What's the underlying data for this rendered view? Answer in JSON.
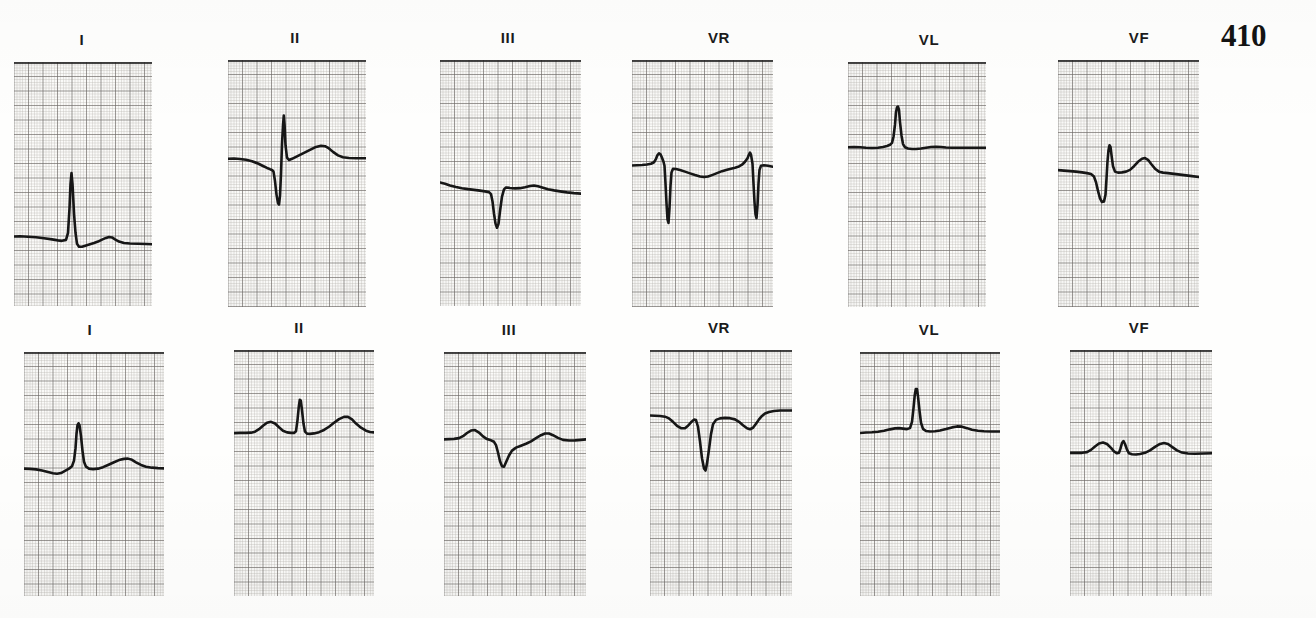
{
  "document": {
    "page_number": "410",
    "type": "ecg-recording",
    "rows": 2,
    "columns": 6
  },
  "chart_data": {
    "type": "line",
    "title": "",
    "subtitle": "",
    "xlabel": "",
    "ylabel": "",
    "grid": true,
    "legend_position": "none",
    "grid_small_px": 2.9,
    "grid_bold_every": 5,
    "rows": [
      {
        "row_index": 0,
        "row_name": "upper-recording",
        "strips": [
          {
            "label": "I",
            "label_x": 82,
            "x": 14,
            "y": 62,
            "width": 138,
            "height": 244,
            "baseline_y": 0.715,
            "points": "0,0.715 6,0.714 14,0.716 22,0.718 30,0.722 38,0.727 44,0.731 48,0.733 52,0.729 54,0.70 55.5,0.60 56.5,0.50 57.5,0.455 58.5,0.50 60,0.62 61.5,0.70 63,0.745 65,0.757 68,0.757 72,0.752 76,0.747 80,0.742 84,0.736 88,0.728 92,0.721 95,0.717 98,0.719 101,0.727 105,0.736 110,0.742 116,0.744 124,0.745 132,0.746 138,0.747"
          },
          {
            "label": "II",
            "label_x": 295,
            "x": 228,
            "y": 60,
            "width": 138,
            "height": 247,
            "baseline_y": 0.4,
            "points": "0,0.400 6,0.399 12,0.401 18,0.404 24,0.410 30,0.419 35,0.429 39,0.437 42,0.442 44,0.445 45.5,0.452 47,0.49 48.5,0.545 50,0.58 51,0.585 52,0.55 53,0.46 54,0.34 55,0.265 55.8,0.225 56.6,0.265 57.5,0.345 59,0.395 61,0.405 64,0.400 68,0.392 73,0.382 78,0.372 83,0.362 88,0.352 93,0.347 97,0.349 101,0.358 105,0.372 110,0.386 115,0.394 121,0.397 128,0.398 134,0.398 138,0.398"
          },
          {
            "label": "III",
            "label_x": 508,
            "x": 440,
            "y": 60,
            "width": 141,
            "height": 246,
            "baseline_y": 0.505,
            "points": "0,0.498 5,0.503 10,0.510 16,0.516 22,0.521 28,0.525 34,0.528 40,0.531 45,0.534 49,0.537 51,0.545 52.5,0.575 54,0.625 55.5,0.665 57,0.682 58.5,0.666 60,0.615 62,0.555 64,0.526 66,0.518 70,0.520 75,0.522 80,0.521 85,0.517 90,0.512 94,0.510 98,0.513 103,0.519 108,0.525 114,0.530 120,0.534 127,0.538 134,0.541 141,0.543"
          },
          {
            "label": "VR",
            "label_x": 719,
            "x": 632,
            "y": 60,
            "width": 141,
            "height": 247,
            "baseline_y": 0.42,
            "points": "0,0.427 5,0.426 10,0.425 15,0.423 19,0.420 22,0.414 24,0.400 25.5,0.385 27,0.378 28.5,0.382 30,0.396 31.5,0.412 32.5,0.428 33.5,0.50 34.5,0.58 35.5,0.645 36.5,0.66 37.5,0.60 38.5,0.51 39.5,0.455 41,0.440 44,0.441 48,0.445 53,0.452 58,0.459 63,0.466 68,0.472 72,0.474 76,0.472 80,0.466 85,0.458 90,0.450 95,0.444 99,0.440 103,0.436 107,0.431 110,0.424 113,0.412 115.5,0.398 117,0.383 118,0.375 119,0.383 120.5,0.42 121.5,0.50 122.5,0.575 123.5,0.625 124.5,0.64 125.5,0.59 126.5,0.50 127.5,0.445 129,0.428 132,0.426 136,0.428 141,0.432"
          },
          {
            "label": "VL",
            "label_x": 929,
            "x": 848,
            "y": 62,
            "width": 138,
            "height": 245,
            "baseline_y": 0.345,
            "points": "0,0.348 6,0.347 12,0.348 18,0.350 24,0.351 30,0.350 35,0.347 39,0.343 42,0.338 44,0.330 45.5,0.305 47,0.255 48,0.205 49,0.185 50,0.182 51,0.195 52,0.245 53.5,0.300 55,0.335 57,0.348 60,0.353 64,0.355 68,0.355 73,0.353 78,0.350 83,0.347 88,0.346 93,0.347 98,0.349 104,0.350 110,0.350 118,0.350 126,0.350 132,0.350 138,0.350"
          },
          {
            "label": "VF",
            "label_x": 1139,
            "x": 1058,
            "y": 60,
            "width": 141,
            "height": 247,
            "baseline_y": 0.45,
            "points": "0,0.446 6,0.448 12,0.450 18,0.452 24,0.455 29,0.458 33,0.462 36,0.472 38,0.495 40,0.530 42,0.560 44,0.575 46,0.573 47.5,0.545 48.5,0.48 49.5,0.41 50.5,0.365 51.5,0.345 52.5,0.352 53.5,0.385 55,0.430 57,0.452 60,0.456 64,0.455 68,0.452 72,0.445 76,0.430 80,0.412 84,0.400 87,0.397 90,0.404 93,0.420 97,0.440 101,0.452 105,0.456 110,0.458 116,0.461 122,0.464 128,0.467 134,0.470 141,0.474"
          }
        ]
      },
      {
        "row_index": 1,
        "row_name": "lower-recording",
        "strips": [
          {
            "label": "I",
            "label_x": 90,
            "x": 24,
            "y": 352,
            "width": 140,
            "height": 244,
            "baseline_y": 0.475,
            "points": "0,0.478 6,0.479 12,0.481 18,0.486 24,0.492 29,0.497 33,0.499 37,0.496 41,0.487 45,0.478 48,0.468 50,0.445 51.5,0.395 52.5,0.335 53.5,0.300 54.5,0.292 55.5,0.300 57,0.345 58.5,0.405 60,0.450 62,0.470 65,0.478 69,0.480 74,0.478 79,0.472 84,0.463 90,0.452 95,0.443 100,0.438 104,0.437 108,0.442 112,0.452 117,0.463 122,0.470 128,0.474 134,0.476 140,0.477"
          },
          {
            "label": "II",
            "label_x": 299,
            "x": 234,
            "y": 350,
            "width": 140,
            "height": 246,
            "baseline_y": 0.335,
            "points": "0,0.338 6,0.337 12,0.337 17,0.336 21,0.332 25,0.322 29,0.308 33,0.296 37,0.292 41,0.299 45,0.314 49,0.328 53,0.335 57,0.337 60,0.337 62,0.330 63.5,0.285 64.8,0.230 65.8,0.202 66.8,0.205 68,0.245 69.5,0.300 71,0.332 73,0.340 76,0.341 80,0.339 85,0.334 90,0.325 95,0.312 100,0.296 105,0.281 110,0.272 114,0.272 118,0.282 122,0.299 127,0.316 132,0.328 136,0.333 140,0.335"
          },
          {
            "label": "III",
            "label_x": 509,
            "x": 444,
            "y": 352,
            "width": 142,
            "height": 244,
            "baseline_y": 0.355,
            "points": "0,0.358 5,0.357 10,0.356 15,0.353 19,0.345 23,0.332 27,0.322 31,0.320 35,0.330 39,0.346 43,0.357 47,0.362 50,0.368 52,0.382 54,0.412 56,0.448 58,0.468 60,0.470 62,0.452 65,0.424 68,0.404 72,0.392 77,0.384 82,0.376 87,0.366 92,0.353 97,0.341 101,0.334 105,0.334 109,0.341 114,0.352 119,0.360 125,0.363 131,0.362 137,0.360 142,0.358"
          },
          {
            "label": "VR",
            "label_x": 719,
            "x": 650,
            "y": 350,
            "width": 142,
            "height": 246,
            "baseline_y": 0.27,
            "points": "0,0.266 5,0.267 10,0.268 15,0.271 19,0.278 23,0.292 27,0.308 31,0.318 35,0.318 38,0.308 41,0.294 44,0.283 46,0.285 48,0.312 50,0.372 52,0.440 54,0.482 55.5,0.490 57,0.462 59,0.404 61,0.342 63,0.302 66,0.284 70,0.278 75,0.276 80,0.277 85,0.282 89,0.292 93,0.306 97,0.318 100,0.322 103,0.316 106,0.300 109,0.282 112,0.268 115,0.258 119,0.252 124,0.248 130,0.246 136,0.246 142,0.246"
          },
          {
            "label": "VL",
            "label_x": 929,
            "x": 860,
            "y": 352,
            "width": 140,
            "height": 244,
            "baseline_y": 0.325,
            "points": "0,0.332 6,0.330 12,0.329 18,0.327 24,0.323 30,0.317 35,0.313 39,0.312 43,0.314 47,0.316 50,0.312 52,0.286 53.5,0.230 54.8,0.175 55.8,0.152 57,0.152 58,0.182 59.5,0.240 61,0.290 63,0.315 66,0.324 70,0.326 75,0.325 80,0.322 86,0.316 92,0.309 97,0.305 102,0.306 107,0.312 112,0.319 118,0.323 124,0.325 131,0.326 140,0.326"
          },
          {
            "label": "VF",
            "label_x": 1139,
            "x": 1070,
            "y": 350,
            "width": 142,
            "height": 246,
            "baseline_y": 0.415,
            "points": "0,0.418 6,0.418 12,0.418 17,0.415 21,0.406 25,0.392 29,0.380 33,0.376 37,0.382 41,0.398 44,0.412 47,0.420 49,0.418 50.5,0.400 52,0.378 53.5,0.370 55,0.382 57,0.405 59,0.420 62,0.424 66,0.425 70,0.423 75,0.418 80,0.408 85,0.394 90,0.382 94,0.378 98,0.382 102,0.394 107,0.408 112,0.417 118,0.421 125,0.422 133,0.421 142,0.420"
          }
        ]
      }
    ]
  },
  "colors": {
    "paper": "#fbfbf9",
    "grid_fine": "#b9b4b0",
    "grid_bold": "#6e6966",
    "trace": "#161616",
    "label_text": "#1b1b1b",
    "page_number": "#131313"
  },
  "page_number_position": {
    "x": 1221,
    "y": 20
  }
}
